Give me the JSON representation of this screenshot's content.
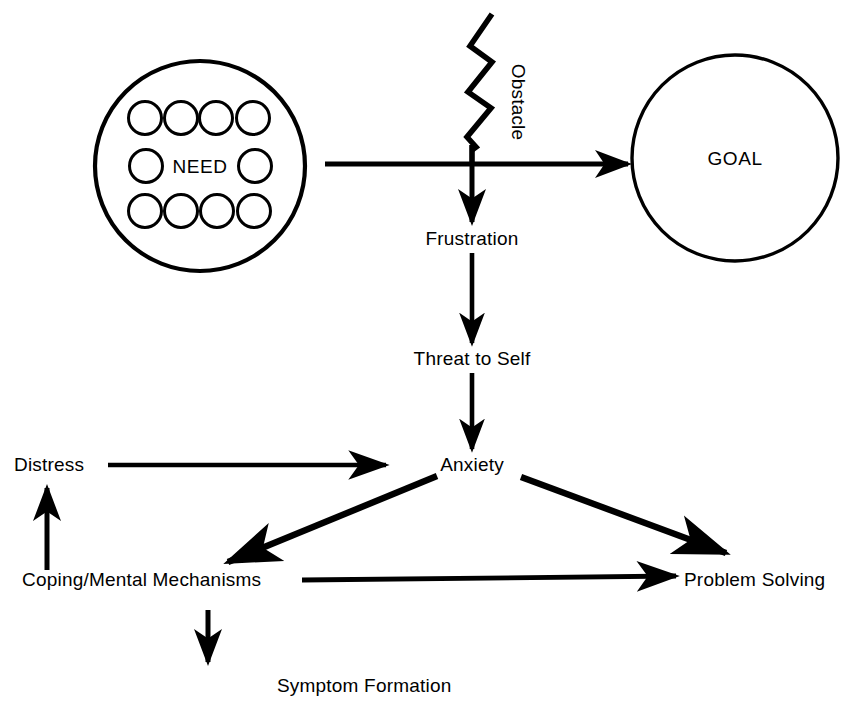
{
  "diagram": {
    "background_color": "#ffffff",
    "stroke_color": "#000000",
    "width": 856,
    "height": 705,
    "nodes": {
      "need": {
        "label": "NEED",
        "shape": "circle",
        "cx": 200,
        "cy": 166,
        "r": 105,
        "inner_circle_count": 10,
        "inner_circle_r": 16
      },
      "goal": {
        "label": "GOAL",
        "shape": "circle",
        "cx": 735,
        "cy": 158,
        "r": 103
      },
      "obstacle": {
        "label": "Obstacle",
        "shape": "zigzag",
        "rotation_deg": 90,
        "x": 518,
        "y": 102
      },
      "frustration": {
        "label": "Frustration",
        "x": 472,
        "y": 238
      },
      "threat_to_self": {
        "label": "Threat to Self",
        "x": 472,
        "y": 358
      },
      "anxiety": {
        "label": "Anxiety",
        "x": 472,
        "y": 464
      },
      "distress": {
        "label": "Distress",
        "x": 53,
        "y": 464
      },
      "coping_mental_mechanisms": {
        "label": "Coping/Mental Mechanisms",
        "x": 158,
        "y": 579
      },
      "problem_solving": {
        "label": "Problem Solving",
        "x": 760,
        "y": 579
      },
      "symptom_formation": {
        "label": "Symptom Formation",
        "x": 373,
        "y": 685
      }
    },
    "edges": [
      {
        "name": "need-to-goal",
        "from": "need",
        "to": "goal",
        "orientation": "horizontal-right"
      },
      {
        "name": "obstacle-to-frustration",
        "from": "obstacle",
        "to": "frustration",
        "orientation": "vertical-down"
      },
      {
        "name": "frustration-to-threat",
        "from": "frustration",
        "to": "threat_to_self",
        "orientation": "vertical-down"
      },
      {
        "name": "threat-to-anxiety",
        "from": "threat_to_self",
        "to": "anxiety",
        "orientation": "vertical-down"
      },
      {
        "name": "distress-to-anxiety",
        "from": "distress",
        "to": "anxiety",
        "orientation": "horizontal-right"
      },
      {
        "name": "anxiety-to-coping",
        "from": "anxiety",
        "to": "coping_mental_mechanisms",
        "orientation": "diagonal-down-left"
      },
      {
        "name": "anxiety-to-problem-solving",
        "from": "anxiety",
        "to": "problem_solving",
        "orientation": "diagonal-down-right"
      },
      {
        "name": "coping-to-distress",
        "from": "coping_mental_mechanisms",
        "to": "distress",
        "orientation": "vertical-up"
      },
      {
        "name": "coping-to-problem-solving",
        "from": "coping_mental_mechanisms",
        "to": "problem_solving",
        "orientation": "horizontal-right"
      },
      {
        "name": "coping-to-symptom-formation",
        "from": "coping_mental_mechanisms",
        "to": "symptom_formation",
        "orientation": "vertical-down"
      }
    ]
  }
}
